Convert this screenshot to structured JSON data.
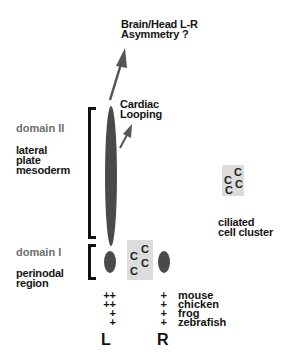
{
  "title_top": {
    "line1": "Brain/Head L-R",
    "line2": "Asymmetry ?"
  },
  "cardiac": {
    "line1": "Cardiac",
    "line2": "Looping"
  },
  "domain2": {
    "label": "domain II",
    "tissue_line1": "lateral",
    "tissue_line2": "plate",
    "tissue_line3": "mesoderm"
  },
  "domain1": {
    "label": "domain I",
    "region_line1": "perinodal",
    "region_line2": "region"
  },
  "cilia": {
    "glyph": "C",
    "label_line1": "ciliated",
    "label_line2": "cell cluster"
  },
  "expression": {
    "rows": [
      {
        "species": "mouse",
        "left": "++",
        "right": "+"
      },
      {
        "species": "chicken",
        "left": "++",
        "right": "+"
      },
      {
        "species": "frog",
        "left": "+",
        "right": "+"
      },
      {
        "species": "zebrafish",
        "left": "+",
        "right": "+"
      }
    ]
  },
  "sides": {
    "left": "L",
    "right": "R"
  },
  "colors": {
    "shape_fill": "#4a4a4a",
    "arrow": "#555555",
    "cilia_box": "#dcdcdc",
    "domain_label": "#6e6e6e"
  }
}
